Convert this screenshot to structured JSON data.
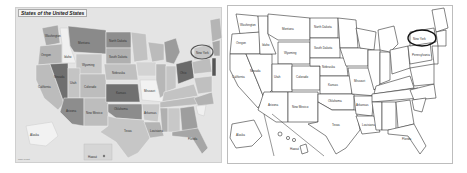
{
  "left_map": {
    "title": "States of the United States",
    "style": "shaded-choropleth",
    "background": "#e4e4e4",
    "highlight": {
      "state": "New York",
      "marker": "circle",
      "color": "#555555"
    },
    "labels": {
      "washington": "Washington",
      "oregon": "Oregon",
      "idaho": "Idaho",
      "montana": "Montana",
      "north_dakota": "North Dakota",
      "south_dakota": "South Dakota",
      "wyoming": "Wyoming",
      "nebraska": "Nebraska",
      "nevada": "Nevada",
      "utah": "Utah",
      "colorado": "Colorado",
      "kansas": "Kansas",
      "california": "California",
      "arizona": "Arizona",
      "new_mexico": "New Mexico",
      "oklahoma": "Oklahoma",
      "texas": "Texas",
      "missouri": "Missouri",
      "arkansas": "Arkansas",
      "louisiana": "Louisiana",
      "ohio": "Ohio",
      "new_york": "New York",
      "alaska": "Alaska",
      "hawaii": "Hawaii",
      "florida": "Florida"
    },
    "credit": "map credit"
  },
  "right_map": {
    "style": "outline",
    "background": "#ffffff",
    "highlight": {
      "state": "New York",
      "marker": "circle",
      "color": "#111111"
    },
    "labels": {
      "washington": "Washington",
      "oregon": "Oregon",
      "idaho": "Idaho",
      "montana": "Montana",
      "north_dakota": "North Dakota",
      "south_dakota": "South Dakota",
      "wyoming": "Wyoming",
      "nebraska": "Nebraska",
      "nevada": "Nevada",
      "utah": "Utah",
      "colorado": "Colorado",
      "kansas": "Kansas",
      "california": "California",
      "arizona": "Arizona",
      "new_mexico": "New Mexico",
      "oklahoma": "Oklahoma",
      "texas": "Texas",
      "missouri": "Missouri",
      "arkansas": "Arkansas",
      "louisiana": "Louisiana",
      "new_york": "New York",
      "pennsylvania": "Pennsylvania",
      "alaska": "Alaska",
      "hawaii": "Hawaii",
      "florida": "Florida"
    }
  }
}
